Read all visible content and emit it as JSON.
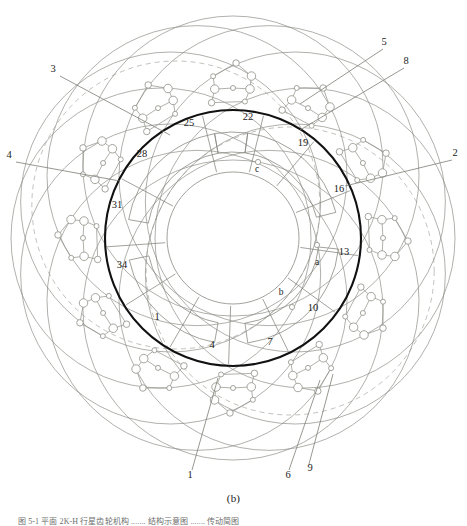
{
  "figure": {
    "sub_label": "(b)",
    "caption_faint": "图 5-1    平面 2K-H 行星齿轮机构 ....... 结构示意图 ....... 传动简图",
    "colors": {
      "main_ring": "#111111",
      "construction_line": "#8a8a84",
      "node_stroke": "#9a9a92",
      "leader_line": "#7d7d76",
      "dashed_line": "#9d9d95",
      "background": "#ffffff",
      "label_text": "#1b1b1b"
    },
    "geometry": {
      "center_x": 233,
      "center_y": 238,
      "main_ring_radius": 128,
      "inner_ring_outer_radius": 106,
      "inner_ring_inner_radius": 86,
      "hub_radius": 66,
      "outer_circle_radius": 150,
      "outer_circle_orbit_radius": 72,
      "outer_circle_count": 12,
      "node_cluster_count": 12
    }
  },
  "labels": {
    "outer_callouts": [
      {
        "id": "callout-3",
        "text": "3",
        "x": 53,
        "y": 72,
        "leader": [
          [
            60,
            76
          ],
          [
            170,
            135
          ]
        ]
      },
      {
        "id": "callout-4",
        "text": "4",
        "x": 9,
        "y": 158,
        "leader": [
          [
            16,
            162
          ],
          [
            120,
            181
          ]
        ]
      },
      {
        "id": "callout-5",
        "text": "5",
        "x": 384,
        "y": 45,
        "leader": [
          [
            383,
            49
          ],
          [
            300,
            104
          ]
        ]
      },
      {
        "id": "callout-8",
        "text": "8",
        "x": 406,
        "y": 64,
        "leader": [
          [
            404,
            68
          ],
          [
            300,
            130
          ]
        ]
      },
      {
        "id": "callout-2",
        "text": "2",
        "x": 455,
        "y": 156,
        "leader": [
          [
            452,
            160
          ],
          [
            345,
            186
          ]
        ]
      },
      {
        "id": "callout-1b",
        "text": "1",
        "x": 190,
        "y": 478,
        "leader": [
          [
            192,
            470
          ],
          [
            218,
            378
          ]
        ]
      },
      {
        "id": "callout-6",
        "text": "6",
        "x": 288,
        "y": 478,
        "leader": [
          [
            289,
            470
          ],
          [
            320,
            380
          ]
        ]
      },
      {
        "id": "callout-9",
        "text": "9",
        "x": 310,
        "y": 471,
        "leader": [
          [
            309,
            464
          ],
          [
            333,
            374
          ]
        ]
      }
    ],
    "inner_annotations": [
      {
        "id": "mark-25",
        "text": "25",
        "x": 189,
        "y": 126
      },
      {
        "id": "mark-22",
        "text": "22",
        "x": 248,
        "y": 120
      },
      {
        "id": "mark-19",
        "text": "19",
        "x": 303,
        "y": 146
      },
      {
        "id": "mark-16",
        "text": "16",
        "x": 339,
        "y": 192
      },
      {
        "id": "mark-13",
        "text": "13",
        "x": 344,
        "y": 255
      },
      {
        "id": "mark-10",
        "text": "10",
        "x": 313,
        "y": 311
      },
      {
        "id": "mark-7",
        "text": "7",
        "x": 270,
        "y": 345
      },
      {
        "id": "mark-4",
        "text": "4",
        "x": 212,
        "y": 348
      },
      {
        "id": "mark-1",
        "text": "1",
        "x": 157,
        "y": 320
      },
      {
        "id": "mark-34",
        "text": "34",
        "x": 122,
        "y": 268
      },
      {
        "id": "mark-31",
        "text": "31",
        "x": 117,
        "y": 208
      },
      {
        "id": "mark-28",
        "text": "28",
        "x": 142,
        "y": 157
      }
    ],
    "point_markers": [
      {
        "id": "point-a",
        "text": "a",
        "x": 317,
        "y": 265,
        "px": 317,
        "py": 245
      },
      {
        "id": "point-b",
        "text": "b",
        "x": 281,
        "y": 295,
        "px": 292,
        "py": 307
      },
      {
        "id": "point-c",
        "text": "c",
        "x": 257,
        "y": 172,
        "px": 258,
        "py": 162
      }
    ],
    "radial_spokes": [
      {
        "id": "spoke-25",
        "angle": -104,
        "mark": "25"
      },
      {
        "id": "spoke-22",
        "angle": -76,
        "mark": "22"
      },
      {
        "id": "spoke-19",
        "angle": -50,
        "mark": "19"
      },
      {
        "id": "spoke-16",
        "angle": -22,
        "mark": "16"
      },
      {
        "id": "spoke-13",
        "angle": 8,
        "mark": "13"
      },
      {
        "id": "spoke-10",
        "angle": 36,
        "mark": "10"
      },
      {
        "id": "spoke-7",
        "angle": 64,
        "mark": "7"
      },
      {
        "id": "spoke-4",
        "angle": 92,
        "mark": "4"
      },
      {
        "id": "spoke-1",
        "angle": 120,
        "mark": "1"
      },
      {
        "id": "spoke-34",
        "angle": 148,
        "mark": "34"
      },
      {
        "id": "spoke-31",
        "angle": 176,
        "mark": "31"
      },
      {
        "id": "spoke-28",
        "angle": 208,
        "mark": "28"
      }
    ]
  }
}
